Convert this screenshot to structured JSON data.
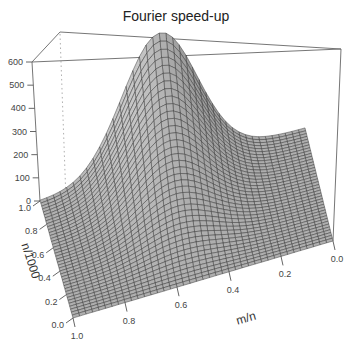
{
  "chart_data": {
    "type": "surface3d",
    "title": "Fourier speed-up",
    "xlabel": "m/n",
    "ylabel": "n/1000",
    "zlabel": "",
    "x_ticks": [
      "0.0",
      "0.2",
      "0.4",
      "0.6",
      "0.8",
      "1.0"
    ],
    "y_ticks": [
      "0.0",
      "0.2",
      "0.4",
      "0.6",
      "0.8",
      "1.0"
    ],
    "z_ticks": [
      "0",
      "100",
      "200",
      "300",
      "400",
      "500",
      "600"
    ],
    "xlim": [
      0,
      1
    ],
    "ylim": [
      0,
      1
    ],
    "zlim": [
      0,
      600
    ],
    "peak": {
      "m_over_n": 0.5,
      "n_over_1000": 1.0,
      "value": 600
    },
    "surface_description": "Bell-shaped surface peaking ~600 near m/n≈0.5 at n/1000=1.0, decaying to ~0 toward m/n=0, m/n=1 and n/1000=0",
    "grid_on_surface": true,
    "surface_color": "#a8a8a8",
    "mesh_color": "#303030"
  },
  "labels": {
    "title": "Fourier speed-up",
    "x_axis": "m/n",
    "y_axis": "n/1000",
    "z_ticks": [
      "600",
      "500",
      "400",
      "300",
      "200",
      "100",
      "0"
    ],
    "y_ticks": [
      "1.0",
      "0.8",
      "0.6",
      "0.4",
      "0.2",
      "0.0"
    ],
    "x_ticks": [
      "1.0",
      "0.8",
      "0.6",
      "0.4",
      "0.2",
      "0.0"
    ]
  }
}
